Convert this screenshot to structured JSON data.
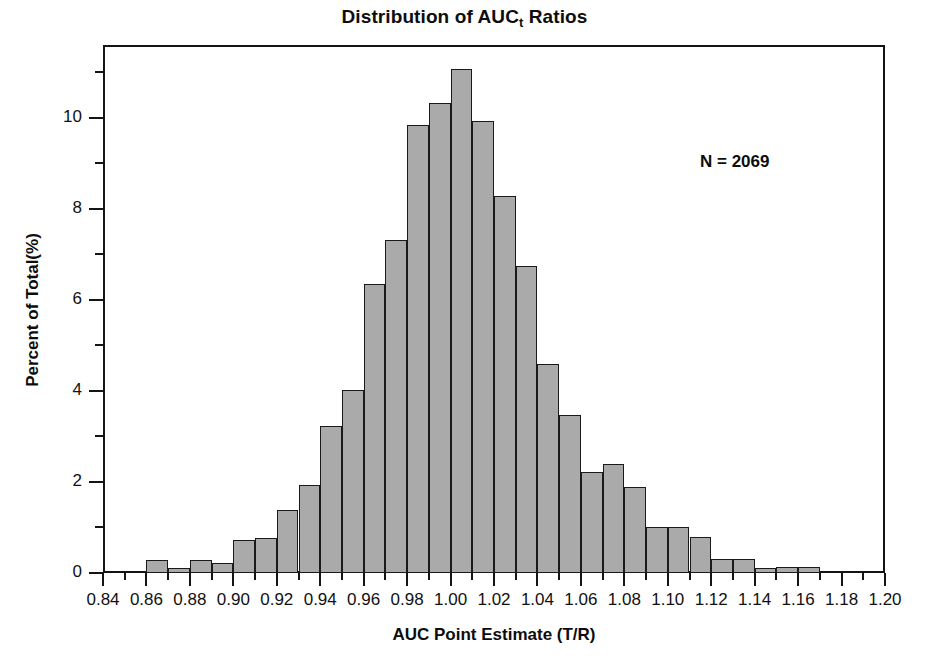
{
  "chart_data": {
    "type": "bar",
    "title": "Distribution of AUCt Ratios",
    "title_main": "Distribution of AUC",
    "title_sub": "t",
    "title_tail": " Ratios",
    "xlabel": "AUC Point Estimate (T/R)",
    "ylabel": "Percent of Total(%)",
    "annotation": "N = 2069",
    "grid": false,
    "legend": "none",
    "xlim": [
      0.84,
      1.2
    ],
    "ylim": [
      0,
      11.6
    ],
    "bin_width": 0.01,
    "x_ticks": [
      "0.84",
      "0.86",
      "0.88",
      "0.90",
      "0.92",
      "0.94",
      "0.96",
      "0.98",
      "1.00",
      "1.02",
      "1.04",
      "1.06",
      "1.08",
      "1.10",
      "1.12",
      "1.14",
      "1.16",
      "1.18",
      "1.20"
    ],
    "x_tick_values": [
      0.84,
      0.86,
      0.88,
      0.9,
      0.92,
      0.94,
      0.96,
      0.98,
      1.0,
      1.02,
      1.04,
      1.06,
      1.08,
      1.1,
      1.12,
      1.14,
      1.16,
      1.18,
      1.2
    ],
    "x_minor_tick_values": [
      0.85,
      0.87,
      0.89,
      0.91,
      0.93,
      0.95,
      0.97,
      0.99,
      1.01,
      1.03,
      1.05,
      1.07,
      1.09,
      1.11,
      1.13,
      1.15,
      1.17,
      1.19
    ],
    "y_ticks": [
      "0",
      "2",
      "4",
      "6",
      "8",
      "10"
    ],
    "y_tick_values": [
      0,
      2,
      4,
      6,
      8,
      10
    ],
    "y_minor_tick_values": [
      1,
      3,
      5,
      7,
      9,
      11
    ],
    "bin_starts": [
      0.84,
      0.85,
      0.86,
      0.87,
      0.88,
      0.89,
      0.9,
      0.91,
      0.92,
      0.93,
      0.94,
      0.95,
      0.96,
      0.97,
      0.98,
      0.99,
      1.0,
      1.01,
      1.02,
      1.03,
      1.04,
      1.05,
      1.06,
      1.07,
      1.08,
      1.09,
      1.1,
      1.11,
      1.12,
      1.13,
      1.14,
      1.15,
      1.16,
      1.17,
      1.18,
      1.19
    ],
    "values": [
      0,
      0,
      0.28,
      0.12,
      0.28,
      0.23,
      0.72,
      0.77,
      1.39,
      1.93,
      3.23,
      4.02,
      6.36,
      7.32,
      9.84,
      10.32,
      11.08,
      9.94,
      8.29,
      6.74,
      4.6,
      3.48,
      2.21,
      2.4,
      1.9,
      1.0,
      1.0,
      0.8,
      0.3,
      0.3,
      0.1,
      0.13,
      0.13,
      0,
      0,
      0
    ]
  }
}
